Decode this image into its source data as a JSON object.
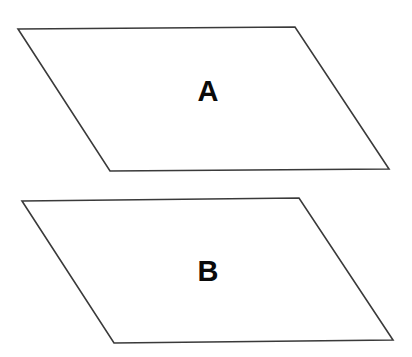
{
  "diagram": {
    "type": "parallelograms",
    "stroke_color": "#3a3a3a",
    "fill_color": "#ffffff",
    "label_color": "#0a0a0a",
    "shapes": [
      {
        "label": "A",
        "points": "18,29 295,27 389,169 110,171",
        "label_x": 208,
        "label_y": 101
      },
      {
        "label": "B",
        "points": "22,201 299,198 393,340 114,343",
        "label_x": 208,
        "label_y": 281
      }
    ]
  }
}
